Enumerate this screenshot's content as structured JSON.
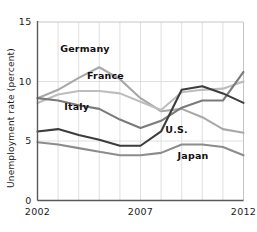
{
  "chart_data": {
    "type": "line",
    "title": "",
    "xlabel": "",
    "ylabel": "Unemployment rate (percent)",
    "xlim": [
      2002,
      2012
    ],
    "ylim": [
      0,
      15
    ],
    "grid": true,
    "legend_position": "inline-labels",
    "x": [
      2002,
      2003,
      2004,
      2005,
      2006,
      2007,
      2008,
      2009,
      2010,
      2011,
      2012
    ],
    "yticks": [
      0,
      5,
      10,
      15
    ],
    "ytick_labels": [
      "0",
      "5",
      "10",
      "15"
    ],
    "xticks": [
      2002,
      2007,
      2012
    ],
    "xtick_labels": [
      "2002",
      "2007",
      "2012"
    ],
    "series": [
      {
        "name": "Germany",
        "color": "#a8a8a8",
        "label": "Germany",
        "values": [
          8.6,
          9.3,
          10.3,
          11.2,
          10.2,
          8.6,
          7.5,
          7.7,
          7.0,
          6.0,
          5.7
        ]
      },
      {
        "name": "France",
        "color": "#bdbdbd",
        "label": "France",
        "values": [
          8.2,
          8.9,
          9.2,
          9.2,
          9.0,
          8.3,
          7.6,
          9.1,
          9.3,
          9.4,
          10.0
        ]
      },
      {
        "name": "Italy",
        "color": "#7a7a7a",
        "label": "Italy",
        "values": [
          8.6,
          8.4,
          8.0,
          7.7,
          6.8,
          6.1,
          6.7,
          7.8,
          8.4,
          8.4,
          10.8
        ]
      },
      {
        "name": "U.S.",
        "color": "#3d3d3d",
        "label": "U.S.",
        "values": [
          5.8,
          6.0,
          5.5,
          5.1,
          4.6,
          4.6,
          5.8,
          9.3,
          9.6,
          9.0,
          8.2
        ]
      },
      {
        "name": "Japan",
        "color": "#8c8c8c",
        "label": "Japan",
        "values": [
          4.9,
          4.7,
          4.4,
          4.1,
          3.8,
          3.8,
          4.0,
          4.7,
          4.7,
          4.5,
          3.8
        ]
      }
    ],
    "annotations": [
      {
        "text": "Germany",
        "x": 2003.1,
        "y": 12.45
      },
      {
        "text": "France",
        "x": 2004.4,
        "y": 10.25
      },
      {
        "text": "Italy",
        "x": 2003.3,
        "y": 7.6
      },
      {
        "text": "U.S.",
        "x": 2008.2,
        "y": 5.7
      },
      {
        "text": "Japan",
        "x": 2008.8,
        "y": 3.45
      }
    ]
  }
}
